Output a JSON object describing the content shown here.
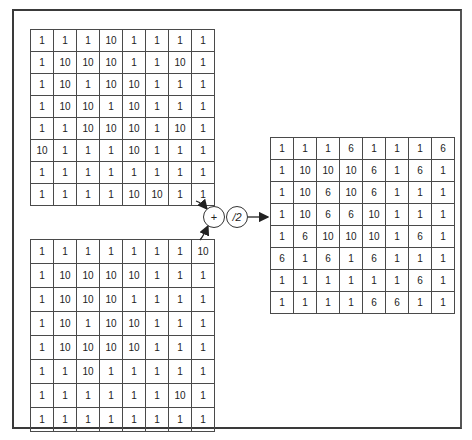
{
  "diagram": {
    "operators": {
      "add": "+",
      "divide": "/2"
    },
    "matrix_a": [
      [
        "1",
        "1",
        "1",
        "10",
        "1",
        "1",
        "1",
        "1"
      ],
      [
        "1",
        "10",
        "10",
        "10",
        "1",
        "1",
        "10",
        "1"
      ],
      [
        "1",
        "10",
        "1",
        "10",
        "10",
        "1",
        "1",
        "1"
      ],
      [
        "1",
        "10",
        "10",
        "1",
        "10",
        "1",
        "1",
        "1"
      ],
      [
        "1",
        "1",
        "10",
        "10",
        "10",
        "1",
        "10",
        "1"
      ],
      [
        "10",
        "1",
        "1",
        "1",
        "10",
        "1",
        "1",
        "1"
      ],
      [
        "1",
        "1",
        "1",
        "1",
        "1",
        "1",
        "1",
        "1"
      ],
      [
        "1",
        "1",
        "1",
        "1",
        "10",
        "10",
        "1",
        "1"
      ]
    ],
    "matrix_b": [
      [
        "1",
        "1",
        "1",
        "1",
        "1",
        "1",
        "1",
        "10"
      ],
      [
        "1",
        "10",
        "10",
        "10",
        "10",
        "1",
        "1",
        "1"
      ],
      [
        "1",
        "10",
        "10",
        "10",
        "1",
        "1",
        "1",
        "1"
      ],
      [
        "1",
        "10",
        "1",
        "10",
        "10",
        "1",
        "1",
        "1"
      ],
      [
        "1",
        "10",
        "10",
        "10",
        "10",
        "1",
        "1",
        "1"
      ],
      [
        "1",
        "1",
        "10",
        "1",
        "1",
        "1",
        "1",
        "1"
      ],
      [
        "1",
        "1",
        "1",
        "1",
        "1",
        "1",
        "10",
        "1"
      ],
      [
        "1",
        "1",
        "1",
        "1",
        "1",
        "1",
        "1",
        "1"
      ]
    ],
    "matrix_result": [
      [
        "1",
        "1",
        "1",
        "6",
        "1",
        "1",
        "1",
        "6"
      ],
      [
        "1",
        "10",
        "10",
        "10",
        "6",
        "1",
        "6",
        "1"
      ],
      [
        "1",
        "10",
        "6",
        "10",
        "6",
        "1",
        "1",
        "1"
      ],
      [
        "1",
        "10",
        "6",
        "6",
        "10",
        "1",
        "1",
        "1"
      ],
      [
        "1",
        "6",
        "10",
        "10",
        "10",
        "1",
        "6",
        "1"
      ],
      [
        "6",
        "1",
        "6",
        "1",
        "6",
        "1",
        "1",
        "1"
      ],
      [
        "1",
        "1",
        "1",
        "1",
        "1",
        "1",
        "6",
        "1"
      ],
      [
        "1",
        "1",
        "1",
        "1",
        "6",
        "6",
        "1",
        "1"
      ]
    ]
  }
}
